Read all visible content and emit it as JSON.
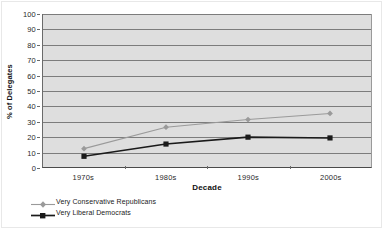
{
  "chart_data": {
    "type": "line",
    "title": "",
    "xlabel": "Decade",
    "ylabel": "% of Delegates",
    "categories": [
      "1970s",
      "1980s",
      "1990s",
      "2000s"
    ],
    "ylim": [
      0,
      100
    ],
    "yticks": [
      0,
      10,
      20,
      30,
      40,
      50,
      60,
      70,
      80,
      90,
      100
    ],
    "grid": "horizontal",
    "legend_position": "bottom-left",
    "series": [
      {
        "name": "Very Conservative Republicans",
        "values": [
          12,
          26,
          31,
          35
        ],
        "color": "#9a9a9a",
        "marker": "diamond"
      },
      {
        "name": "Very Liberal Democrats",
        "values": [
          7,
          15,
          19.5,
          19
        ],
        "color": "#1a1a1a",
        "marker": "square"
      }
    ]
  },
  "axes": {
    "y_tick_labels": [
      "100",
      "90",
      "80",
      "70",
      "60",
      "50",
      "40",
      "30",
      "20",
      "10",
      "0"
    ],
    "x_tick_labels": [
      "1970s",
      "1980s",
      "1990s",
      "2000s"
    ],
    "y_axis_title": "% of Delegates",
    "x_axis_title": "Decade"
  },
  "legend": {
    "items": [
      {
        "label": "Very Conservative Republicans",
        "color": "#9a9a9a",
        "marker": "diamond-icon"
      },
      {
        "label": "Very Liberal Democrats",
        "color": "#1a1a1a",
        "marker": "square-icon"
      }
    ]
  },
  "style": {
    "plot_background": "#dedede",
    "gridline_color": "#7c7c7c",
    "page_background": "#ffffff"
  }
}
